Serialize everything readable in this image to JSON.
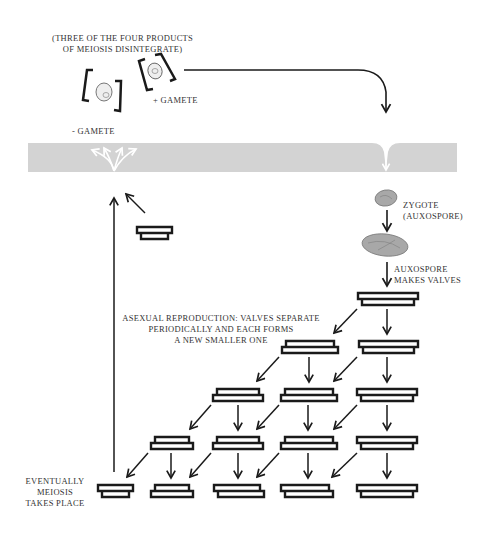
{
  "labels": {
    "meiosis_products_line1": "(THREE OF THE FOUR PRODUCTS",
    "meiosis_products_line2": "OF MEIOSIS DISINTEGRATE)",
    "plus_gamete": "+ GAMETE",
    "minus_gamete": "- GAMETE",
    "zygote_line1": "ZYGOTE",
    "zygote_line2": "(AUXOSPORE)",
    "auxospore_line1": "AUXOSPORE",
    "auxospore_line2": "MAKES VALVES",
    "asexual_line1": "ASEXUAL REPRODUCTION:  VALVES SEPARATE",
    "asexual_line2": "PERIODICALLY AND EACH FORMS",
    "asexual_line3": "A NEW SMALLER ONE",
    "meiosis_line1": "EVENTUALLY",
    "meiosis_line2": "MEIOSIS",
    "meiosis_line3": "TAKES PLACE"
  },
  "colors": {
    "water_band": "#d3d3d3",
    "ink": "#1a1a1a",
    "cell_fill": "#a8a8a8",
    "text": "#333333"
  },
  "diagram": {
    "stages": [
      "Meiosis",
      "+/- gametes",
      "Zygote (auxospore)",
      "Auxospore makes valves",
      "Asexual reproduction",
      "Valves shrink",
      "Meiosis"
    ]
  }
}
